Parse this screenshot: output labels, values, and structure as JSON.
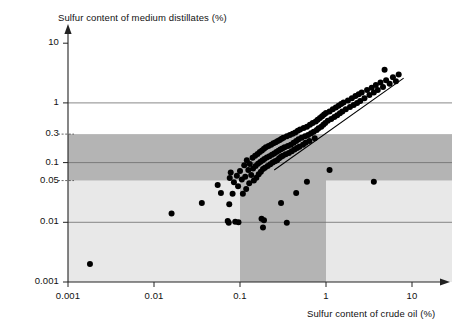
{
  "chart_data": {
    "type": "scatter",
    "title": "",
    "xlabel": "Sulfur content of crude oil (%)",
    "ylabel": "Sulfur content of medium distillates (%)",
    "xscale": "log",
    "yscale": "log",
    "xlim": [
      0.001,
      14
    ],
    "ylim": [
      0.001,
      14
    ],
    "xticks": [
      0.001,
      0.01,
      0.1,
      1,
      10
    ],
    "xticklabels": [
      "0.001",
      "0.01",
      "0.1",
      "1",
      "10"
    ],
    "yticks": [
      0.001,
      0.01,
      0.05,
      0.1,
      0.3,
      1,
      10
    ],
    "yticklabels": [
      "0.001",
      "0.01",
      "0.05",
      "0.1",
      "0.3",
      "1",
      "10"
    ],
    "gridlines_y": [
      0.01,
      0.1,
      1
    ],
    "dashed_ticks_y": [
      0.05,
      0.3
    ],
    "grid": true,
    "legend": null,
    "shaded_regions": [
      {
        "name": "light-band-below-0.05",
        "orientation": "horizontal",
        "y_range": [
          0.001,
          0.05
        ],
        "x_range": [
          0.001,
          14
        ],
        "color": "#e8e8e8"
      },
      {
        "name": "dark-band-0.05-to-0.3",
        "orientation": "horizontal",
        "y_range": [
          0.05,
          0.3
        ],
        "x_range": [
          0.001,
          14
        ],
        "color": "#b4b4b4"
      },
      {
        "name": "dark-band-x-0.1-to-1",
        "orientation": "vertical",
        "x_range": [
          0.1,
          1
        ],
        "y_range": [
          0.001,
          0.3
        ],
        "color": "#b4b4b4"
      }
    ],
    "trendline": {
      "x": [
        0.25,
        8.0
      ],
      "y": [
        0.075,
        2.6
      ]
    },
    "marker": {
      "shape": "circle",
      "color": "#000000",
      "size": 6
    },
    "points": [
      [
        0.0018,
        0.002
      ],
      [
        0.016,
        0.014
      ],
      [
        0.036,
        0.021
      ],
      [
        0.055,
        0.042
      ],
      [
        0.06,
        0.031
      ],
      [
        0.072,
        0.0105
      ],
      [
        0.074,
        0.0098
      ],
      [
        0.075,
        0.02
      ],
      [
        0.076,
        0.055
      ],
      [
        0.078,
        0.068
      ],
      [
        0.082,
        0.03
      ],
      [
        0.085,
        0.047
      ],
      [
        0.088,
        0.0102
      ],
      [
        0.092,
        0.06
      ],
      [
        0.095,
        0.04
      ],
      [
        0.1,
        0.072
      ],
      [
        0.105,
        0.052
      ],
      [
        0.108,
        0.03
      ],
      [
        0.112,
        0.09
      ],
      [
        0.115,
        0.058
      ],
      [
        0.118,
        0.036
      ],
      [
        0.12,
        0.11
      ],
      [
        0.125,
        0.075
      ],
      [
        0.128,
        0.045
      ],
      [
        0.13,
        0.095
      ],
      [
        0.135,
        0.062
      ],
      [
        0.14,
        0.12
      ],
      [
        0.142,
        0.08
      ],
      [
        0.145,
        0.05
      ],
      [
        0.15,
        0.13
      ],
      [
        0.152,
        0.088
      ],
      [
        0.155,
        0.056
      ],
      [
        0.16,
        0.14
      ],
      [
        0.162,
        0.096
      ],
      [
        0.165,
        0.064
      ],
      [
        0.17,
        0.15
      ],
      [
        0.172,
        0.102
      ],
      [
        0.175,
        0.07
      ],
      [
        0.178,
        0.0115
      ],
      [
        0.18,
        0.16
      ],
      [
        0.182,
        0.108
      ],
      [
        0.185,
        0.078
      ],
      [
        0.19,
        0.17
      ],
      [
        0.192,
        0.115
      ],
      [
        0.195,
        0.082
      ],
      [
        0.2,
        0.18
      ],
      [
        0.205,
        0.122
      ],
      [
        0.21,
        0.088
      ],
      [
        0.215,
        0.19
      ],
      [
        0.22,
        0.128
      ],
      [
        0.225,
        0.094
      ],
      [
        0.23,
        0.2
      ],
      [
        0.235,
        0.135
      ],
      [
        0.24,
        0.1
      ],
      [
        0.245,
        0.21
      ],
      [
        0.25,
        0.142
      ],
      [
        0.255,
        0.105
      ],
      [
        0.26,
        0.22
      ],
      [
        0.265,
        0.15
      ],
      [
        0.27,
        0.11
      ],
      [
        0.275,
        0.23
      ],
      [
        0.28,
        0.158
      ],
      [
        0.285,
        0.118
      ],
      [
        0.29,
        0.24
      ],
      [
        0.295,
        0.165
      ],
      [
        0.3,
        0.125
      ],
      [
        0.305,
        0.25
      ],
      [
        0.31,
        0.172
      ],
      [
        0.315,
        0.13
      ],
      [
        0.32,
        0.26
      ],
      [
        0.33,
        0.18
      ],
      [
        0.34,
        0.138
      ],
      [
        0.35,
        0.275
      ],
      [
        0.36,
        0.19
      ],
      [
        0.37,
        0.145
      ],
      [
        0.38,
        0.29
      ],
      [
        0.39,
        0.2
      ],
      [
        0.4,
        0.155
      ],
      [
        0.41,
        0.305
      ],
      [
        0.42,
        0.215
      ],
      [
        0.43,
        0.165
      ],
      [
        0.44,
        0.32
      ],
      [
        0.45,
        0.23
      ],
      [
        0.46,
        0.175
      ],
      [
        0.47,
        0.34
      ],
      [
        0.48,
        0.245
      ],
      [
        0.49,
        0.185
      ],
      [
        0.5,
        0.36
      ],
      [
        0.52,
        0.26
      ],
      [
        0.54,
        0.2
      ],
      [
        0.55,
        0.38
      ],
      [
        0.57,
        0.275
      ],
      [
        0.58,
        0.215
      ],
      [
        0.6,
        0.4
      ],
      [
        0.62,
        0.29
      ],
      [
        0.64,
        0.23
      ],
      [
        0.65,
        0.43
      ],
      [
        0.67,
        0.31
      ],
      [
        0.7,
        0.46
      ],
      [
        0.72,
        0.33
      ],
      [
        0.74,
        0.255
      ],
      [
        0.76,
        0.49
      ],
      [
        0.78,
        0.35
      ],
      [
        0.8,
        0.52
      ],
      [
        0.82,
        0.375
      ],
      [
        0.85,
        0.56
      ],
      [
        0.88,
        0.4
      ],
      [
        0.9,
        0.6
      ],
      [
        0.93,
        0.43
      ],
      [
        0.95,
        0.64
      ],
      [
        0.98,
        0.46
      ],
      [
        1.0,
        0.68
      ],
      [
        1.05,
        0.5
      ],
      [
        1.1,
        0.72
      ],
      [
        1.15,
        0.54
      ],
      [
        1.2,
        0.78
      ],
      [
        1.25,
        0.58
      ],
      [
        1.3,
        0.84
      ],
      [
        1.35,
        0.62
      ],
      [
        1.4,
        0.9
      ],
      [
        1.45,
        0.67
      ],
      [
        1.5,
        0.96
      ],
      [
        1.55,
        0.72
      ],
      [
        1.6,
        1.02
      ],
      [
        1.7,
        0.78
      ],
      [
        1.8,
        1.1
      ],
      [
        1.9,
        0.85
      ],
      [
        2.0,
        1.2
      ],
      [
        2.1,
        0.92
      ],
      [
        2.2,
        1.3
      ],
      [
        2.3,
        1.0
      ],
      [
        2.4,
        1.4
      ],
      [
        2.5,
        1.08
      ],
      [
        2.6,
        1.5
      ],
      [
        2.8,
        1.2
      ],
      [
        3.0,
        1.65
      ],
      [
        3.2,
        1.35
      ],
      [
        3.4,
        1.8
      ],
      [
        3.6,
        1.5
      ],
      [
        3.8,
        2.0
      ],
      [
        4.0,
        1.65
      ],
      [
        4.3,
        2.2
      ],
      [
        4.6,
        1.85
      ],
      [
        5.0,
        2.4
      ],
      [
        5.5,
        2.1
      ],
      [
        6.0,
        2.7
      ],
      [
        6.5,
        2.3
      ],
      [
        7.0,
        3.0
      ],
      [
        4.8,
        3.6
      ],
      [
        0.35,
        0.0098
      ],
      [
        0.3,
        0.021
      ],
      [
        0.45,
        0.031
      ],
      [
        0.6,
        0.048
      ],
      [
        3.6,
        0.048
      ],
      [
        1.1,
        0.075
      ],
      [
        0.19,
        0.0108
      ],
      [
        0.185,
        0.0082
      ],
      [
        0.096,
        0.01
      ]
    ]
  }
}
